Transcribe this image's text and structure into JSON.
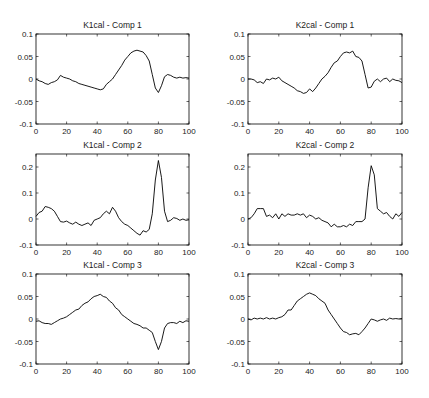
{
  "figure": {
    "width": 429,
    "height": 398,
    "background": "#ffffff",
    "line_color": "#000000",
    "axis_color": "#000000"
  },
  "chart_data": [
    {
      "type": "line",
      "title": "K1cal - Comp 1",
      "xlabel": "",
      "ylabel": "",
      "xlim": [
        0,
        100
      ],
      "ylim": [
        -0.1,
        0.1
      ],
      "xticks": [
        0,
        20,
        40,
        60,
        80,
        100
      ],
      "xtick_labels": [
        "0",
        "20",
        "40",
        "60",
        "80",
        "100"
      ],
      "yticks": [
        -0.1,
        -0.05,
        0,
        0.05,
        0.1
      ],
      "ytick_labels": [
        "-0.1",
        "-0.05",
        "0",
        "0.05",
        "0.1"
      ],
      "grid": false,
      "box": {
        "x": 36,
        "y": 34,
        "w": 153,
        "h": 90
      },
      "x": [
        0,
        2,
        4,
        6,
        8,
        10,
        12,
        14,
        16,
        18,
        20,
        22,
        24,
        26,
        28,
        30,
        32,
        34,
        36,
        38,
        40,
        42,
        44,
        46,
        48,
        50,
        52,
        54,
        56,
        58,
        60,
        62,
        64,
        66,
        68,
        70,
        72,
        74,
        76,
        78,
        80,
        82,
        84,
        86,
        88,
        90,
        92,
        94,
        96,
        98,
        100
      ],
      "y": [
        0,
        -0.004,
        -0.006,
        -0.01,
        -0.012,
        -0.008,
        -0.006,
        -0.002,
        0.008,
        0.004,
        0.002,
        0,
        -0.004,
        -0.006,
        -0.01,
        -0.012,
        -0.014,
        -0.016,
        -0.018,
        -0.02,
        -0.022,
        -0.024,
        -0.022,
        -0.012,
        -0.006,
        0,
        0.01,
        0.02,
        0.03,
        0.042,
        0.05,
        0.058,
        0.062,
        0.064,
        0.062,
        0.06,
        0.052,
        0.04,
        0.01,
        -0.02,
        -0.03,
        -0.015,
        0.005,
        0.01,
        0.008,
        0.004,
        0.002,
        0.004,
        0.002,
        0.003,
        0.002
      ]
    },
    {
      "type": "line",
      "title": "K2cal - Comp 1",
      "xlabel": "",
      "ylabel": "",
      "xlim": [
        0,
        100
      ],
      "ylim": [
        -0.1,
        0.1
      ],
      "xticks": [
        0,
        20,
        40,
        60,
        80,
        100
      ],
      "xtick_labels": [
        "0",
        "20",
        "40",
        "60",
        "80",
        "100"
      ],
      "yticks": [
        -0.1,
        -0.05,
        0,
        0.05,
        0.1
      ],
      "ytick_labels": [
        "-0.1",
        "-0.05",
        "0",
        "0.05",
        "0.1"
      ],
      "grid": false,
      "box": {
        "x": 248,
        "y": 34,
        "w": 154,
        "h": 90
      },
      "x": [
        0,
        2,
        4,
        6,
        8,
        10,
        12,
        14,
        16,
        18,
        20,
        22,
        24,
        26,
        28,
        30,
        32,
        34,
        36,
        38,
        40,
        42,
        44,
        46,
        48,
        50,
        52,
        54,
        56,
        58,
        60,
        62,
        64,
        66,
        68,
        70,
        72,
        74,
        76,
        78,
        80,
        82,
        84,
        86,
        88,
        90,
        92,
        94,
        96,
        98,
        100
      ],
      "y": [
        0,
        0,
        -0.002,
        -0.008,
        -0.006,
        -0.01,
        0,
        -0.002,
        0.002,
        0,
        0.004,
        -0.004,
        -0.008,
        -0.012,
        -0.016,
        -0.02,
        -0.026,
        -0.028,
        -0.032,
        -0.03,
        -0.022,
        -0.028,
        -0.02,
        -0.01,
        0,
        0.006,
        0.014,
        0.026,
        0.036,
        0.04,
        0.05,
        0.058,
        0.06,
        0.058,
        0.062,
        0.05,
        0.048,
        0.04,
        0.01,
        -0.02,
        -0.018,
        -0.005,
        0,
        -0.006,
        0,
        0.002,
        -0.006,
        0,
        -0.003,
        -0.004,
        -0.008
      ]
    },
    {
      "type": "line",
      "title": "K1cal - Comp 2",
      "xlabel": "",
      "ylabel": "",
      "xlim": [
        0,
        100
      ],
      "ylim": [
        -0.1,
        0.25
      ],
      "xticks": [
        0,
        20,
        40,
        60,
        80,
        100
      ],
      "xtick_labels": [
        "0",
        "20",
        "40",
        "60",
        "80",
        "100"
      ],
      "yticks": [
        -0.1,
        0,
        0.1,
        0.2
      ],
      "ytick_labels": [
        "-0.1",
        "0",
        "0.1",
        "0.2"
      ],
      "grid": false,
      "box": {
        "x": 36,
        "y": 154,
        "w": 153,
        "h": 91
      },
      "x": [
        0,
        2,
        4,
        6,
        8,
        10,
        12,
        14,
        16,
        18,
        20,
        22,
        24,
        26,
        28,
        30,
        32,
        34,
        36,
        38,
        40,
        42,
        44,
        46,
        48,
        50,
        52,
        54,
        56,
        58,
        60,
        62,
        64,
        66,
        68,
        70,
        72,
        74,
        76,
        78,
        80,
        82,
        84,
        86,
        88,
        90,
        92,
        94,
        96,
        98,
        100
      ],
      "y": [
        0.01,
        0.025,
        0.03,
        0.048,
        0.045,
        0.04,
        0.03,
        0.01,
        -0.01,
        -0.012,
        -0.008,
        -0.015,
        -0.02,
        -0.012,
        -0.02,
        -0.025,
        -0.02,
        -0.015,
        -0.025,
        -0.005,
        0,
        0.005,
        0.02,
        0.03,
        0.02,
        0.045,
        0.03,
        0.005,
        -0.01,
        -0.02,
        -0.025,
        -0.035,
        -0.045,
        -0.055,
        -0.062,
        -0.045,
        -0.05,
        -0.04,
        0.02,
        0.15,
        0.225,
        0.16,
        0.03,
        -0.01,
        -0.005,
        0.005,
        0.002,
        -0.005,
        0,
        -0.005,
        -0.003
      ]
    },
    {
      "type": "line",
      "title": "K2cal - Comp 2",
      "xlabel": "",
      "ylabel": "",
      "xlim": [
        0,
        100
      ],
      "ylim": [
        -0.1,
        0.25
      ],
      "xticks": [
        0,
        20,
        40,
        60,
        80,
        100
      ],
      "xtick_labels": [
        "0",
        "20",
        "40",
        "60",
        "80",
        "100"
      ],
      "yticks": [
        -0.1,
        0,
        0.1,
        0.2
      ],
      "ytick_labels": [
        "-0.1",
        "0",
        "0.1",
        "0.2"
      ],
      "grid": false,
      "box": {
        "x": 248,
        "y": 154,
        "w": 154,
        "h": 91
      },
      "x": [
        0,
        2,
        4,
        6,
        8,
        10,
        12,
        14,
        16,
        18,
        20,
        22,
        24,
        26,
        28,
        30,
        32,
        34,
        36,
        38,
        40,
        42,
        44,
        46,
        48,
        50,
        52,
        54,
        56,
        58,
        60,
        62,
        64,
        66,
        68,
        70,
        72,
        74,
        76,
        78,
        80,
        82,
        84,
        86,
        88,
        90,
        92,
        94,
        96,
        98,
        100
      ],
      "y": [
        0,
        0.005,
        0.02,
        0.04,
        0.04,
        0.04,
        0.01,
        0.015,
        0.005,
        0.02,
        0,
        0.02,
        0.01,
        0.02,
        0.015,
        0.015,
        0.02,
        0.015,
        0.02,
        0.005,
        0.015,
        0.01,
        0,
        0.005,
        -0.005,
        -0.01,
        -0.015,
        -0.03,
        -0.02,
        -0.03,
        -0.03,
        -0.025,
        -0.03,
        -0.02,
        -0.025,
        -0.01,
        -0.01,
        -0.01,
        0,
        0.12,
        0.205,
        0.17,
        0.04,
        0.03,
        0.02,
        0.025,
        0.01,
        0,
        0.02,
        0.01,
        0.025
      ]
    },
    {
      "type": "line",
      "title": "K1cal - Comp 3",
      "xlabel": "",
      "ylabel": "",
      "xlim": [
        0,
        100
      ],
      "ylim": [
        -0.1,
        0.1
      ],
      "xticks": [
        0,
        20,
        40,
        60,
        80,
        100
      ],
      "xtick_labels": [
        "0",
        "20",
        "40",
        "60",
        "80",
        "100"
      ],
      "yticks": [
        -0.1,
        -0.05,
        0,
        0.05,
        0.1
      ],
      "ytick_labels": [
        "-0.1",
        "-0.05",
        "0",
        "0.05",
        "0.1"
      ],
      "grid": false,
      "box": {
        "x": 36,
        "y": 274,
        "w": 153,
        "h": 90
      },
      "x": [
        0,
        2,
        4,
        6,
        8,
        10,
        12,
        14,
        16,
        18,
        20,
        22,
        24,
        26,
        28,
        30,
        32,
        34,
        36,
        38,
        40,
        42,
        44,
        46,
        48,
        50,
        52,
        54,
        56,
        58,
        60,
        62,
        64,
        66,
        68,
        70,
        72,
        74,
        76,
        78,
        80,
        82,
        84,
        86,
        88,
        90,
        92,
        94,
        96,
        98,
        100
      ],
      "y": [
        -0.005,
        -0.004,
        -0.008,
        -0.01,
        -0.01,
        -0.012,
        -0.008,
        -0.004,
        0,
        0.002,
        0.005,
        0.01,
        0.015,
        0.02,
        0.022,
        0.03,
        0.035,
        0.038,
        0.045,
        0.05,
        0.052,
        0.055,
        0.05,
        0.048,
        0.04,
        0.035,
        0.025,
        0.02,
        0.01,
        0.005,
        0,
        -0.005,
        -0.01,
        -0.012,
        -0.015,
        -0.02,
        -0.02,
        -0.025,
        -0.03,
        -0.05,
        -0.068,
        -0.05,
        -0.02,
        -0.01,
        -0.008,
        -0.008,
        -0.01,
        -0.005,
        -0.008,
        -0.004,
        -0.005
      ]
    },
    {
      "type": "line",
      "title": "K2cal - Comp 3",
      "xlabel": "",
      "ylabel": "",
      "xlim": [
        0,
        100
      ],
      "ylim": [
        -0.1,
        0.1
      ],
      "xticks": [
        0,
        20,
        40,
        60,
        80,
        100
      ],
      "xtick_labels": [
        "0",
        "20",
        "40",
        "60",
        "80",
        "100"
      ],
      "yticks": [
        -0.1,
        -0.05,
        0,
        0.05,
        0.1
      ],
      "ytick_labels": [
        "-0.1",
        "-0.05",
        "0",
        "0.05",
        "0.1"
      ],
      "grid": false,
      "box": {
        "x": 248,
        "y": 274,
        "w": 154,
        "h": 90
      },
      "x": [
        0,
        2,
        4,
        6,
        8,
        10,
        12,
        14,
        16,
        18,
        20,
        22,
        24,
        26,
        28,
        30,
        32,
        34,
        36,
        38,
        40,
        42,
        44,
        46,
        48,
        50,
        52,
        54,
        56,
        58,
        60,
        62,
        64,
        66,
        68,
        70,
        72,
        74,
        76,
        78,
        80,
        82,
        84,
        86,
        88,
        90,
        92,
        94,
        96,
        98,
        100
      ],
      "y": [
        0,
        -0.002,
        0.002,
        0,
        0.002,
        0,
        0.003,
        0,
        0.002,
        0,
        0.003,
        0.005,
        0.01,
        0.02,
        0.02,
        0.03,
        0.04,
        0.045,
        0.05,
        0.055,
        0.058,
        0.055,
        0.052,
        0.045,
        0.04,
        0.035,
        0.02,
        0.01,
        0,
        -0.01,
        -0.02,
        -0.028,
        -0.03,
        -0.035,
        -0.033,
        -0.032,
        -0.035,
        -0.028,
        -0.02,
        -0.01,
        0,
        -0.002,
        -0.005,
        -0.002,
        0,
        -0.003,
        0.002,
        0,
        0.001,
        0,
        0.001
      ]
    }
  ]
}
